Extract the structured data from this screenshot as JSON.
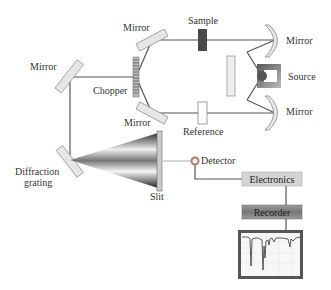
{
  "diagram": {
    "type": "double-beam spectrometer schematic",
    "labels": {
      "mirror_top_left": "Mirror",
      "mirror_left": "Mirror",
      "mirror_bottom": "Mirror",
      "mirror_right_top": "Mirror",
      "mirror_right_bottom": "Mirror",
      "sample": "Sample",
      "reference": "Reference",
      "source": "Source",
      "chopper": "Chopper",
      "diffraction_line1": "Diffraction",
      "diffraction_line2": "grating",
      "slit": "Slit",
      "detector": "Detector",
      "electronics": "Electronics",
      "recorder": "Recorder"
    },
    "colors": {
      "beam": "#555555",
      "mirror_fill": "#e6e6e6",
      "sample_fill": "#4a4a4a",
      "box_light": "#d4d4d4",
      "box_dark": "#8a8a8a",
      "detector": "#b07a78"
    }
  }
}
